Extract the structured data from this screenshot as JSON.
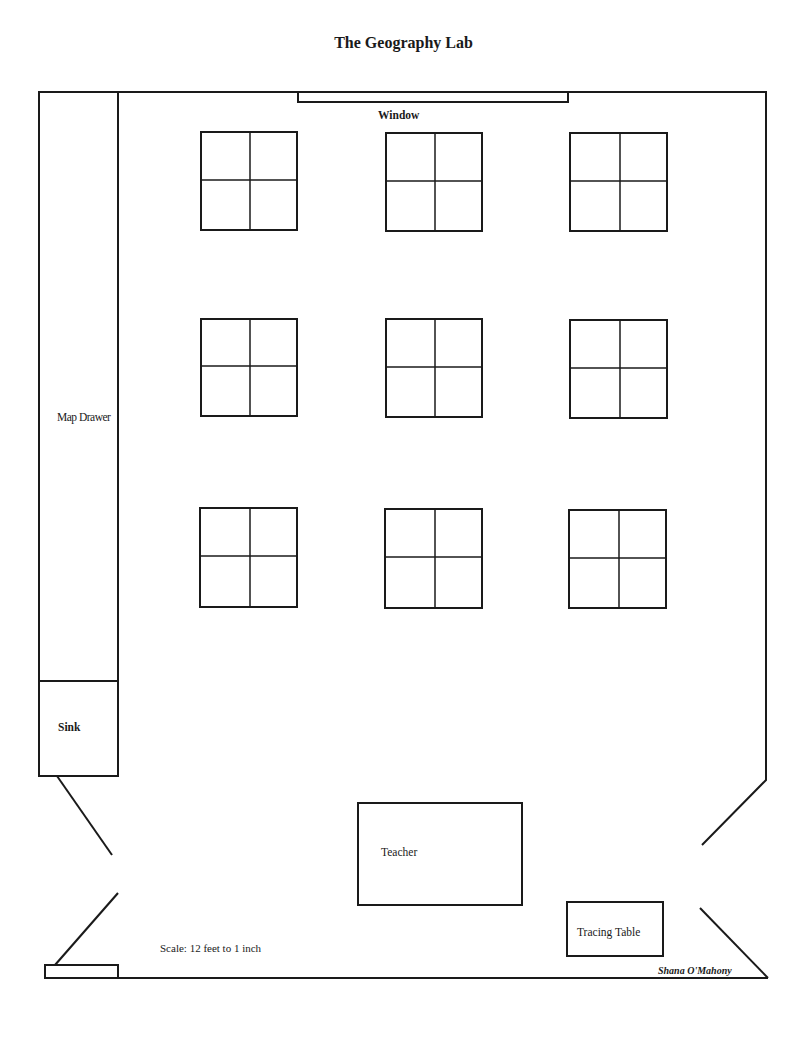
{
  "title": "The Geography Lab",
  "labels": {
    "window": "Window",
    "map_drawer": "Map Drawer",
    "sink": "Sink",
    "teacher": "Teacher",
    "tracing_table": "Tracing Table",
    "scale": "Scale:  12 feet to 1 inch",
    "author": "Shana O'Mahony"
  },
  "student_tables": {
    "rows": 3,
    "columns": 3,
    "seats_per_table": 4,
    "count": 9
  },
  "colors": {
    "line": "#1a1a1a",
    "background": "#ffffff"
  }
}
